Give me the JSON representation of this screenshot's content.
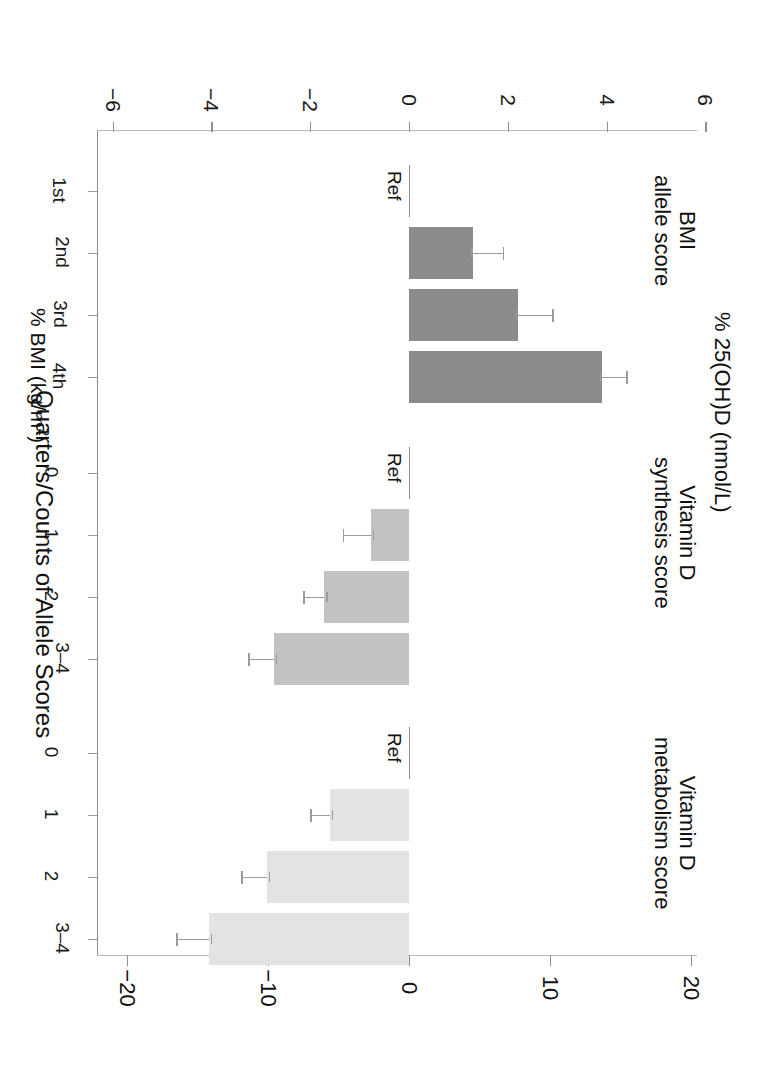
{
  "chart_data": {
    "type": "bar",
    "orientation": "horizontal",
    "title": "",
    "top_axis": {
      "label": "% BMI (kg/m",
      "label_sup": "2",
      "label_tail": ")",
      "full_label": "% BMI (kg/m2)",
      "ticks": [
        -6,
        -4,
        -2,
        0,
        2,
        4,
        6
      ],
      "ticklabels": [
        "−6",
        "−4",
        "−2",
        "0",
        "2",
        "4",
        "6"
      ],
      "lim": [
        -6.2,
        6.2
      ]
    },
    "bottom_axis": {
      "label": "% 25(OH)D (nmol/L)",
      "ticks": [
        -20,
        -10,
        0,
        10,
        20
      ],
      "ticklabels": [
        "−20",
        "−10",
        "0",
        "10",
        "20"
      ],
      "lim": [
        -22,
        22
      ]
    },
    "ylabel": "Quarters/Counts of Allele Scores",
    "grid": false,
    "legend": "none",
    "reference_label": "Ref",
    "groups": [
      {
        "name": "BMI allele score",
        "label_lines": [
          "BMI",
          "allele score"
        ],
        "axis": "top",
        "color": "#8b8b8b",
        "categories": [
          "1st",
          "2nd",
          "3rd",
          "4th"
        ],
        "values": [
          0,
          1.3,
          2.2,
          3.9
        ],
        "ci_low": [
          0,
          0.7,
          1.6,
          3.3
        ],
        "ci_high": [
          0,
          1.9,
          2.9,
          4.4
        ],
        "reference_category": "1st"
      },
      {
        "name": "Vitamin D synthesis score",
        "label_lines": [
          "Vitamin D",
          "synthesis score"
        ],
        "axis": "bottom",
        "color": "#c2c2c2",
        "categories": [
          "0",
          "1",
          "2",
          "3–4"
        ],
        "values": [
          0,
          -2.7,
          -6.0,
          -9.6
        ],
        "ci_low": [
          0,
          -4.7,
          -7.5,
          -11.4
        ],
        "ci_high": [
          0,
          -0.7,
          -4.5,
          -7.8
        ],
        "reference_category": "0"
      },
      {
        "name": "Vitamin D metabolism score",
        "label_lines": [
          "Vitamin D",
          "metabolism score"
        ],
        "axis": "bottom",
        "color": "#e3e3e3",
        "categories": [
          "0",
          "1",
          "2",
          "3–4"
        ],
        "values": [
          0,
          -5.6,
          -10.1,
          -14.2
        ],
        "ci_low": [
          0,
          -7.0,
          -11.9,
          -16.5
        ],
        "ci_high": [
          0,
          -4.2,
          -8.3,
          -11.9
        ],
        "reference_category": "0"
      }
    ]
  },
  "colors": {
    "bmi_bar": "#8b8b8b",
    "vitd_synthesis_bar": "#c2c2c2",
    "vitd_metabolism_bar": "#e3e3e3",
    "axis": "#9a9a9a",
    "text": "#111111"
  }
}
